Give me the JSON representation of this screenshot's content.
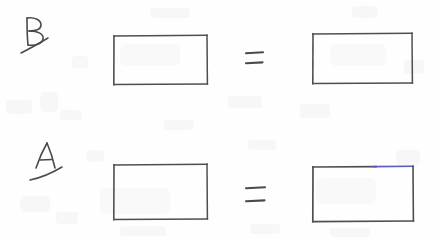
{
  "document": {
    "kind": "hand-drawn-worksheet",
    "medium": "scanned pencil drawing on white paper",
    "width": 434,
    "height": 241,
    "background_color": "#fefefe",
    "ink_color": "#4a4a4a",
    "accent_ink_color": "#5b5bc0"
  },
  "rows": [
    {
      "id": "row-b",
      "label": "B",
      "label_underlined": true,
      "relation": "=",
      "left_shape": {
        "type": "rectangle",
        "x": 114,
        "y": 36,
        "width": 93,
        "height": 48,
        "stroke_color": "#4a4a4a"
      },
      "right_shape": {
        "type": "rectangle",
        "x": 313,
        "y": 34,
        "width": 99,
        "height": 49,
        "stroke_color": "#4a4a4a"
      }
    },
    {
      "id": "row-a",
      "label": "A",
      "label_underlined": true,
      "relation": "=",
      "left_shape": {
        "type": "rectangle",
        "x": 114,
        "y": 165,
        "width": 93,
        "height": 54,
        "stroke_color": "#4a4a4a"
      },
      "right_shape": {
        "type": "rectangle",
        "x": 313,
        "y": 167,
        "width": 100,
        "height": 54,
        "stroke_color": "#4a4a4a",
        "accent_edge": "top-right",
        "accent_color": "#5b5bc0"
      }
    }
  ],
  "equals_signs": [
    {
      "id": "equals-row-b",
      "symbol": "=",
      "x": 246,
      "y": 52,
      "stroke_length": 17
    },
    {
      "id": "equals-row-a",
      "symbol": "=",
      "x": 246,
      "y": 187,
      "stroke_length": 19
    }
  ]
}
